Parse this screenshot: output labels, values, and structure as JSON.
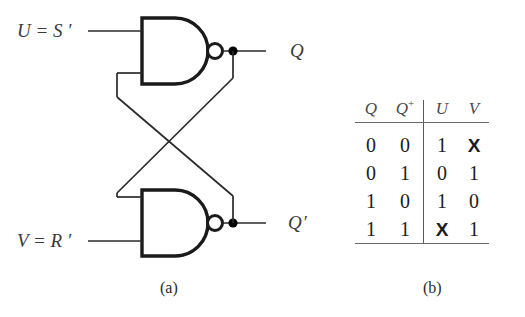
{
  "figure": {
    "caption_a": "(a)",
    "caption_b": "(b)"
  },
  "circuit": {
    "title": "NAND-based SR latch (cross-coupled)",
    "inputs": [
      {
        "name": "top-input",
        "label_var": "U",
        "operator": "=",
        "label_expr": "S",
        "prime": "′",
        "full": "U = S ′"
      },
      {
        "name": "bottom-input",
        "label_var": "V",
        "operator": "=",
        "label_expr": "R",
        "prime": "′",
        "full": "V = R ′"
      }
    ],
    "outputs": [
      {
        "name": "top-output",
        "label": "Q",
        "prime": ""
      },
      {
        "name": "bottom-output",
        "label": "Q",
        "prime": "′"
      }
    ],
    "gates": [
      {
        "name": "nand-gate-top",
        "type": "NAND"
      },
      {
        "name": "nand-gate-bottom",
        "type": "NAND"
      }
    ],
    "colors": {
      "wire": "#2a2a2a",
      "gate_outline": "#1a1a1a",
      "node_fill": "#000000",
      "label_text": "#3a3a3a"
    }
  },
  "truth_table": {
    "headers": [
      "Q",
      "Q",
      "U",
      "V"
    ],
    "header_superscripts": [
      "",
      "+",
      "",
      ""
    ],
    "rows": [
      {
        "Q": "0",
        "Qplus": "0",
        "U": "1",
        "V": "X"
      },
      {
        "Q": "0",
        "Qplus": "1",
        "U": "0",
        "V": "1"
      },
      {
        "Q": "1",
        "Qplus": "0",
        "U": "1",
        "V": "0"
      },
      {
        "Q": "1",
        "Qplus": "1",
        "U": "X",
        "V": "1"
      }
    ]
  }
}
